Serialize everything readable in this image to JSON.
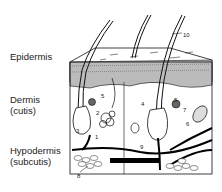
{
  "diagram": {
    "layers": [
      {
        "id": "epidermis",
        "label": "Epidermis"
      },
      {
        "id": "dermis",
        "label": "Dermis",
        "sublabel": "(cutis)"
      },
      {
        "id": "hypodermis",
        "label": "Hypodermis",
        "sublabel": "(subcutis)"
      }
    ],
    "callouts": [
      {
        "n": "10",
        "x": 183,
        "y": 32
      },
      {
        "n": "5",
        "x": 101,
        "y": 93
      },
      {
        "n": "5",
        "x": 174,
        "y": 97
      },
      {
        "n": "2",
        "x": 96,
        "y": 110
      },
      {
        "n": "4",
        "x": 141,
        "y": 101
      },
      {
        "n": "7",
        "x": 183,
        "y": 107
      },
      {
        "n": "3",
        "x": 76,
        "y": 128
      },
      {
        "n": "1",
        "x": 95,
        "y": 134
      },
      {
        "n": "6",
        "x": 186,
        "y": 121
      },
      {
        "n": "9",
        "x": 140,
        "y": 144
      },
      {
        "n": "8",
        "x": 77,
        "y": 173
      }
    ]
  }
}
